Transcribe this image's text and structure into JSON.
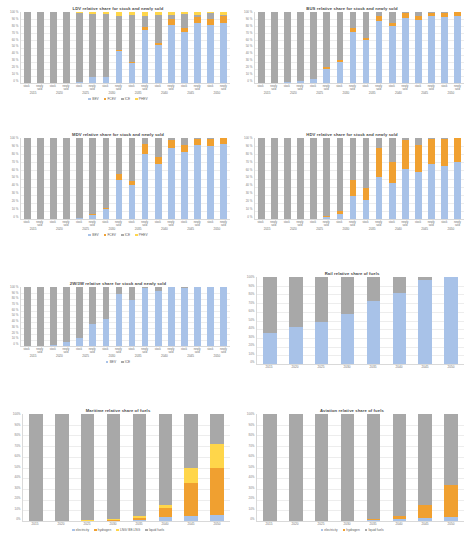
{
  "colors": {
    "bev": "#a8c2e8",
    "fcev": "#f0a030",
    "ice": "#a8a8a8",
    "phev": "#ffd64a",
    "electricity": "#a8c2e8",
    "hydrogen": "#f0a030",
    "lng": "#ffd64a",
    "liquid_fuels": "#a8a8a8"
  },
  "axis": {
    "ticks_vehicle": [
      "100 %",
      "90 %",
      "80 %",
      "70 %",
      "60 %",
      "50 %",
      "40 %",
      "30 %",
      "20 %",
      "10 %",
      "0 %"
    ],
    "ticks_fuel": [
      "100%",
      "90%",
      "80%",
      "70%",
      "60%",
      "50%",
      "40%",
      "30%",
      "20%",
      "10%",
      "0%"
    ],
    "categories": [
      "stock",
      "newly sold"
    ],
    "years_vehicle": [
      "2015",
      "2020",
      "2025",
      "2030",
      "2035",
      "2040",
      "2045",
      "2050"
    ],
    "years_fuel": [
      "2015",
      "2020",
      "2025",
      "2030",
      "2035",
      "2040",
      "2045",
      "2050"
    ]
  },
  "legends": {
    "vehicle4": [
      {
        "label": "BEV",
        "color": "#a8c2e8"
      },
      {
        "label": "FCEV",
        "color": "#f0a030"
      },
      {
        "label": "ICE",
        "color": "#a8a8a8"
      },
      {
        "label": "PHEV",
        "color": "#ffd64a"
      }
    ],
    "vehicle2": [
      {
        "label": "BEV",
        "color": "#a8c2e8"
      },
      {
        "label": "ICE",
        "color": "#a8a8a8"
      }
    ],
    "fuel4": [
      {
        "label": "electricity",
        "color": "#a8c2e8"
      },
      {
        "label": "hydrogen",
        "color": "#f0a030"
      },
      {
        "label": "LNG/ BE-LNG",
        "color": "#ffd64a"
      },
      {
        "label": "liquid fuels",
        "color": "#a8a8a8"
      }
    ],
    "fuel3": [
      {
        "label": "electricity",
        "color": "#a8c2e8"
      },
      {
        "label": "hydrogen",
        "color": "#f0a030"
      },
      {
        "label": "liquid fuels",
        "color": "#a8a8a8"
      }
    ]
  },
  "chart_data": [
    {
      "id": "ldv",
      "type": "bar",
      "title": "LDV relative share for stock and newly sold",
      "stacked": true,
      "normalized": true,
      "ylabel": "",
      "xlabel": "",
      "ylim": [
        0,
        100
      ],
      "grid": true,
      "legend_position": "bottom",
      "legend_key": "vehicle4",
      "categories": [
        "2015 stock",
        "2015 newly sold",
        "2020 stock",
        "2020 newly sold",
        "2025 stock",
        "2025 newly sold",
        "2030 stock",
        "2030 newly sold",
        "2035 stock",
        "2035 newly sold",
        "2040 stock",
        "2040 newly sold",
        "2045 stock",
        "2045 newly sold",
        "2050 stock",
        "2050 newly sold"
      ],
      "series": [
        {
          "name": "BEV",
          "color": "#a8c2e8",
          "values": [
            0,
            0,
            0,
            0,
            2,
            9,
            9,
            45,
            28,
            74,
            53,
            82,
            72,
            84,
            82,
            85
          ]
        },
        {
          "name": "FCEV",
          "color": "#f0a030",
          "values": [
            0,
            0,
            0,
            0,
            0,
            0,
            0,
            1,
            1,
            5,
            3,
            8,
            6,
            9,
            8,
            9
          ]
        },
        {
          "name": "ICE",
          "color": "#a8a8a8",
          "values": [
            100,
            100,
            100,
            100,
            97,
            88,
            88,
            48,
            67,
            16,
            40,
            6,
            19,
            3,
            8,
            2
          ]
        },
        {
          "name": "PHEV",
          "color": "#ffd64a",
          "values": [
            0,
            0,
            0,
            0,
            1,
            3,
            3,
            6,
            4,
            5,
            4,
            4,
            3,
            4,
            2,
            4
          ]
        }
      ]
    },
    {
      "id": "bus",
      "type": "bar",
      "title": "BUS relative share for stock and newly sold",
      "stacked": true,
      "normalized": true,
      "ylim": [
        0,
        100
      ],
      "grid": true,
      "legend_position": "bottom",
      "legend_key": "vehicle4",
      "categories": [
        "2015 stock",
        "2015 newly sold",
        "2020 stock",
        "2020 newly sold",
        "2025 stock",
        "2025 newly sold",
        "2030 stock",
        "2030 newly sold",
        "2035 stock",
        "2035 newly sold",
        "2040 stock",
        "2040 newly sold",
        "2045 stock",
        "2045 newly sold",
        "2050 stock",
        "2050 newly sold"
      ],
      "series": [
        {
          "name": "BEV",
          "color": "#a8c2e8",
          "values": [
            0,
            0,
            1,
            3,
            6,
            20,
            30,
            72,
            60,
            88,
            80,
            92,
            89,
            94,
            93,
            95
          ]
        },
        {
          "name": "FCEV",
          "color": "#f0a030",
          "values": [
            0,
            0,
            0,
            0,
            0,
            2,
            2,
            6,
            4,
            6,
            5,
            6,
            5,
            5,
            5,
            5
          ]
        },
        {
          "name": "ICE",
          "color": "#a8a8a8",
          "values": [
            100,
            100,
            99,
            97,
            94,
            78,
            68,
            22,
            36,
            6,
            15,
            2,
            6,
            1,
            2,
            0
          ]
        },
        {
          "name": "PHEV",
          "color": "#ffd64a",
          "values": [
            0,
            0,
            0,
            0,
            0,
            0,
            0,
            0,
            0,
            0,
            0,
            0,
            0,
            0,
            0,
            0
          ]
        }
      ]
    },
    {
      "id": "mdv",
      "type": "bar",
      "title": "MDV relative share for stock and newly sold",
      "stacked": true,
      "normalized": true,
      "ylim": [
        0,
        100
      ],
      "grid": true,
      "legend_position": "bottom",
      "legend_key": "vehicle4",
      "categories": [
        "2015 stock",
        "2015 newly sold",
        "2020 stock",
        "2020 newly sold",
        "2025 stock",
        "2025 newly sold",
        "2030 stock",
        "2030 newly sold",
        "2035 stock",
        "2035 newly sold",
        "2040 stock",
        "2040 newly sold",
        "2045 stock",
        "2045 newly sold",
        "2050 stock",
        "2050 newly sold"
      ],
      "series": [
        {
          "name": "BEV",
          "color": "#a8c2e8",
          "values": [
            0,
            0,
            0,
            0,
            1,
            5,
            12,
            48,
            42,
            80,
            68,
            88,
            83,
            91,
            90,
            93
          ]
        },
        {
          "name": "FCEV",
          "color": "#f0a030",
          "values": [
            0,
            0,
            0,
            0,
            0,
            1,
            2,
            8,
            5,
            12,
            8,
            10,
            9,
            8,
            9,
            7
          ]
        },
        {
          "name": "ICE",
          "color": "#a8a8a8",
          "values": [
            100,
            100,
            100,
            100,
            99,
            94,
            86,
            44,
            53,
            8,
            24,
            2,
            8,
            1,
            1,
            0
          ]
        },
        {
          "name": "PHEV",
          "color": "#ffd64a",
          "values": [
            0,
            0,
            0,
            0,
            0,
            0,
            0,
            0,
            0,
            0,
            0,
            0,
            0,
            0,
            0,
            0
          ]
        }
      ]
    },
    {
      "id": "hdv",
      "type": "bar",
      "title": "HDV relative share for stock and newly sold",
      "stacked": true,
      "normalized": true,
      "ylim": [
        0,
        100
      ],
      "grid": true,
      "legend_position": "bottom",
      "legend_key": "vehicle4",
      "categories": [
        "2015 stock",
        "2015 newly sold",
        "2020 stock",
        "2020 newly sold",
        "2025 stock",
        "2025 newly sold",
        "2030 stock",
        "2030 newly sold",
        "2035 stock",
        "2035 newly sold",
        "2040 stock",
        "2040 newly sold",
        "2045 stock",
        "2045 newly sold",
        "2050 stock",
        "2050 newly sold"
      ],
      "series": [
        {
          "name": "BEV",
          "color": "#a8c2e8",
          "values": [
            0,
            0,
            0,
            0,
            0,
            2,
            6,
            28,
            24,
            52,
            44,
            62,
            58,
            68,
            66,
            70
          ]
        },
        {
          "name": "FCEV",
          "color": "#f0a030",
          "values": [
            0,
            0,
            0,
            0,
            0,
            2,
            4,
            20,
            14,
            36,
            26,
            36,
            33,
            31,
            33,
            30
          ]
        },
        {
          "name": "ICE",
          "color": "#a8a8a8",
          "values": [
            100,
            100,
            100,
            100,
            100,
            96,
            90,
            52,
            62,
            12,
            30,
            2,
            9,
            1,
            1,
            0
          ]
        },
        {
          "name": "PHEV",
          "color": "#ffd64a",
          "values": [
            0,
            0,
            0,
            0,
            0,
            0,
            0,
            0,
            0,
            0,
            0,
            0,
            0,
            0,
            0,
            0
          ]
        }
      ]
    },
    {
      "id": "2w3w",
      "type": "bar",
      "title": "2W/3W relative share for stock and newly sold",
      "stacked": true,
      "normalized": true,
      "ylim": [
        0,
        100
      ],
      "grid": true,
      "legend_position": "bottom",
      "legend_key": "vehicle2",
      "categories": [
        "2015 stock",
        "2015 newly sold",
        "2020 stock",
        "2020 newly sold",
        "2025 stock",
        "2025 newly sold",
        "2030 stock",
        "2030 newly sold",
        "2035 stock",
        "2035 newly sold",
        "2040 stock",
        "2040 newly sold",
        "2045 stock",
        "2045 newly sold",
        "2050 stock",
        "2050 newly sold"
      ],
      "series": [
        {
          "name": "BEV",
          "color": "#a8c2e8",
          "values": [
            0,
            0,
            2,
            6,
            14,
            38,
            46,
            88,
            78,
            98,
            94,
            100,
            99,
            100,
            100,
            100
          ]
        },
        {
          "name": "ICE",
          "color": "#a8a8a8",
          "values": [
            100,
            100,
            98,
            94,
            86,
            62,
            54,
            12,
            22,
            2,
            6,
            0,
            1,
            0,
            0,
            0
          ]
        }
      ]
    },
    {
      "id": "rail",
      "type": "bar",
      "title": "Rail relative share of fuels",
      "stacked": true,
      "normalized": true,
      "ylim": [
        0,
        100
      ],
      "grid": true,
      "legend_position": "none",
      "legend_key": "fuel4",
      "categories": [
        "2015",
        "2020",
        "2025",
        "2030",
        "2035",
        "2040",
        "2045",
        "2050"
      ],
      "series": [
        {
          "name": "electricity",
          "color": "#a8c2e8",
          "values": [
            36,
            42,
            48,
            58,
            72,
            82,
            96,
            100
          ]
        },
        {
          "name": "hydrogen",
          "color": "#f0a030",
          "values": [
            0,
            0,
            0,
            0,
            0,
            0,
            0,
            0
          ]
        },
        {
          "name": "LNG/ BE-LNG",
          "color": "#ffd64a",
          "values": [
            0,
            0,
            0,
            0,
            0,
            0,
            0,
            0
          ]
        },
        {
          "name": "liquid fuels",
          "color": "#a8a8a8",
          "values": [
            64,
            58,
            52,
            42,
            28,
            18,
            4,
            0
          ]
        }
      ]
    },
    {
      "id": "maritime",
      "type": "bar",
      "title": "Maritime relative share of fuels",
      "stacked": true,
      "normalized": true,
      "ylim": [
        0,
        100
      ],
      "grid": true,
      "legend_position": "bottom",
      "legend_key": "fuel4",
      "categories": [
        "2015",
        "2020",
        "2025",
        "2030",
        "2035",
        "2040",
        "2045",
        "2050"
      ],
      "series": [
        {
          "name": "electricity",
          "color": "#a8c2e8",
          "values": [
            0,
            0,
            0,
            0,
            1,
            4,
            5,
            6
          ]
        },
        {
          "name": "hydrogen",
          "color": "#f0a030",
          "values": [
            0,
            0,
            0,
            1,
            2,
            8,
            31,
            44
          ]
        },
        {
          "name": "LNG/ BE-LNG",
          "color": "#ffd64a",
          "values": [
            0,
            0,
            1,
            1,
            2,
            3,
            14,
            22
          ]
        },
        {
          "name": "liquid fuels",
          "color": "#a8a8a8",
          "values": [
            100,
            100,
            99,
            98,
            95,
            85,
            50,
            28
          ]
        }
      ]
    },
    {
      "id": "aviation",
      "type": "bar",
      "title": "Aviation relative share of fuels",
      "stacked": true,
      "normalized": true,
      "ylim": [
        0,
        100
      ],
      "grid": true,
      "legend_position": "bottom",
      "legend_key": "fuel3",
      "categories": [
        "2015",
        "2020",
        "2025",
        "2030",
        "2035",
        "2040",
        "2045",
        "2050"
      ],
      "series": [
        {
          "name": "electricity",
          "color": "#a8c2e8",
          "values": [
            0,
            0,
            0,
            0,
            1,
            2,
            3,
            4
          ]
        },
        {
          "name": "hydrogen",
          "color": "#f0a030",
          "values": [
            0,
            0,
            0,
            0,
            1,
            3,
            12,
            30
          ]
        },
        {
          "name": "liquid fuels",
          "color": "#a8a8a8",
          "values": [
            100,
            100,
            100,
            100,
            98,
            95,
            85,
            66
          ]
        }
      ]
    }
  ]
}
